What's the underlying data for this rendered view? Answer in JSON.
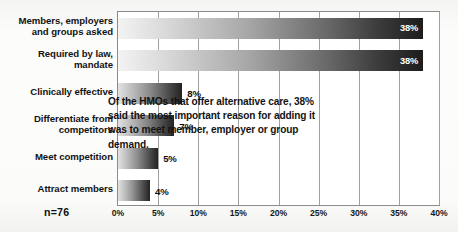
{
  "chart_data": {
    "type": "bar",
    "orientation": "horizontal",
    "title": "",
    "xlabel": "",
    "ylabel": "",
    "categories": [
      "Members, employers and groups asked",
      "Required by law, mandate",
      "Clinically effective",
      "Differentiate from competitors",
      "Meet competition",
      "Attract members"
    ],
    "category_lines": [
      [
        "Members, employers",
        "and groups asked"
      ],
      [
        "Required by law,",
        "mandate"
      ],
      [
        "Clinically effective"
      ],
      [
        "Differentiate from",
        "competitors"
      ],
      [
        "Meet competition"
      ],
      [
        "Attract members"
      ]
    ],
    "values": [
      38,
      38,
      8,
      7,
      5,
      4
    ],
    "value_labels": [
      "38%",
      "38%",
      "8%",
      "7%",
      "5%",
      "4%"
    ],
    "label_placement": [
      "inside",
      "inside",
      "outside",
      "outside",
      "outside",
      "outside"
    ],
    "xlim": [
      0,
      40
    ],
    "xticks": [
      0,
      5,
      10,
      15,
      20,
      25,
      30,
      35,
      40
    ],
    "xticklabels": [
      "0%",
      "5%",
      "10%",
      "15%",
      "20%",
      "25%",
      "30%",
      "35%",
      "40%"
    ],
    "grid": true,
    "grid_axis": "x",
    "legend": false,
    "bar_fill": "grayscale-gradient-light-to-dark"
  },
  "annotation": {
    "text": "Of the HMOs that offer alternative care, 38% said the most important reason for adding it was to meet member, employer or group demand."
  },
  "sample_size": {
    "label": "n=76"
  },
  "colors": {
    "background": "#fbfbfa",
    "plot_background": "#ffffff",
    "axis": "#8b8b8b",
    "gridline": "#a0a0a0",
    "text": "#131313",
    "bar_light": "#f3f3f3",
    "bar_dark": "#1d1d1d",
    "value_label_inside": "#ffffff",
    "value_label_outside": "#0d0d0d"
  }
}
